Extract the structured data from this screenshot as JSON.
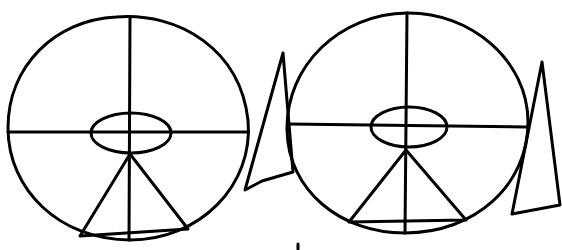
{
  "diagram": {
    "colors": {
      "background": "#ffffff",
      "stroke": "#000000"
    },
    "figures": [
      {
        "name": "left-figure",
        "circle": {
          "cx": 128,
          "cy": 128,
          "rx": 120,
          "ry": 112
        },
        "vertical_line": {
          "x1": 130,
          "y1": 16,
          "x2": 129,
          "y2": 240
        },
        "horizontal_line": {
          "x1": 8,
          "y1": 132,
          "x2": 248,
          "y2": 132
        },
        "ellipse": {
          "cx": 131,
          "cy": 133,
          "rx": 40,
          "ry": 21
        },
        "triangle": {
          "apex": [
            130,
            154
          ],
          "left": [
            80,
            236
          ],
          "right": [
            188,
            229
          ]
        },
        "spike": {
          "points": [
            [
              283,
              53
            ],
            [
              245,
              190
            ],
            [
              293,
              172
            ]
          ]
        }
      },
      {
        "name": "right-figure",
        "circle": {
          "cx": 407,
          "cy": 123,
          "rx": 121,
          "ry": 110
        },
        "vertical_line": {
          "x1": 407,
          "y1": 13,
          "x2": 405,
          "y2": 233
        },
        "horizontal_line": {
          "x1": 288,
          "y1": 124,
          "x2": 526,
          "y2": 127
        },
        "ellipse": {
          "cx": 409,
          "cy": 127,
          "rx": 38,
          "ry": 20
        },
        "triangle": {
          "apex": [
            406,
            150
          ],
          "left": [
            349,
            222
          ],
          "right": [
            466,
            220
          ]
        },
        "spike": {
          "points": [
            [
              542,
              62
            ],
            [
              512,
              214
            ],
            [
              560,
              205
            ]
          ]
        }
      }
    ],
    "stray_mark": {
      "x": 298,
      "y": 247
    }
  }
}
